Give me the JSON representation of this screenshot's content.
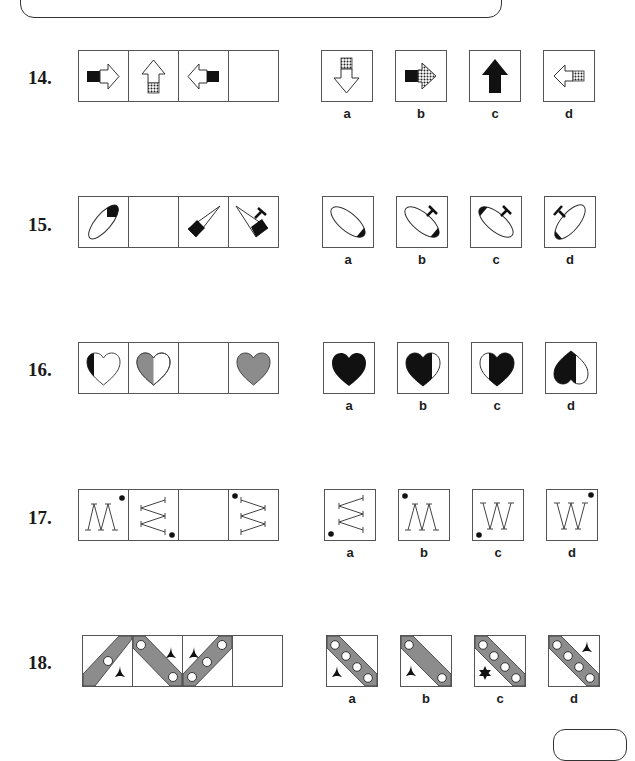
{
  "page": {
    "header_banner": "",
    "footer_tab": ""
  },
  "questions": [
    {
      "number": "14.",
      "sequence": [
        "arrow-right-black-tail",
        "arrow-up-dotted-tail",
        "arrow-left-black-tail",
        "blank"
      ],
      "options": [
        {
          "label": "a",
          "figure": "arrow-down-dotted-tail"
        },
        {
          "label": "b",
          "figure": "arrow-right-black-tail-dotted-head"
        },
        {
          "label": "c",
          "figure": "arrow-up-solid-black"
        },
        {
          "label": "d",
          "figure": "arrow-left-dotted-tail"
        }
      ]
    },
    {
      "number": "15.",
      "sequence": [
        "ellipse-black-top",
        "blank",
        "cone-black-base",
        "cone-black-base-with-t"
      ],
      "options": [
        {
          "label": "a",
          "figure": "ellipse-black-bottom"
        },
        {
          "label": "b",
          "figure": "ellipse-black-bottom-with-t"
        },
        {
          "label": "c",
          "figure": "ellipse-black-top-left-with-t"
        },
        {
          "label": "d",
          "figure": "ellipse-black-bottom-left-with-t"
        }
      ]
    },
    {
      "number": "16.",
      "sequence": [
        "heart-left-edge-black",
        "heart-left-half-grey",
        "blank",
        "heart-full-grey"
      ],
      "options": [
        {
          "label": "a",
          "figure": "heart-full-black"
        },
        {
          "label": "b",
          "figure": "heart-black-right-white-sliver"
        },
        {
          "label": "c",
          "figure": "heart-black-left-white-sliver"
        },
        {
          "label": "d",
          "figure": "heart-inverted-black-left"
        }
      ]
    },
    {
      "number": "17.",
      "sequence": [
        "m-zigzag-dot-top-right",
        "sideways-zigzag-dot-bottom-right",
        "blank",
        "sideways-zigzag-dot-top-left"
      ],
      "options": [
        {
          "label": "a",
          "figure": "sideways-zigzag-dot-bottom-left"
        },
        {
          "label": "b",
          "figure": "m-zigzag-dot-top-left"
        },
        {
          "label": "c",
          "figure": "w-zigzag-dot-bottom-left"
        },
        {
          "label": "d",
          "figure": "w-zigzag-dot-top-right"
        }
      ]
    },
    {
      "number": "18.",
      "sequence": [
        "band-rising-1-circle-tri-star",
        "band-falling-2-circles-tri-star",
        "band-rising-3-circles-tri-star",
        "blank"
      ],
      "options": [
        {
          "label": "a",
          "figure": "band-falling-4-circles-tri-star-bottom-left"
        },
        {
          "label": "b",
          "figure": "band-falling-2-circles-tri-star-bottom-left"
        },
        {
          "label": "c",
          "figure": "band-falling-4-circles-six-star-bottom-left"
        },
        {
          "label": "d",
          "figure": "band-falling-4-circles-tri-star-top-right"
        }
      ]
    }
  ],
  "colors": {
    "grey_fill": "#8c8c8c",
    "black_fill": "#111111",
    "line": "#333333"
  }
}
